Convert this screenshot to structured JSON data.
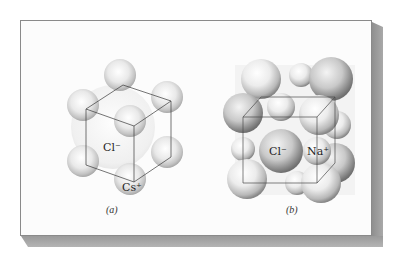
{
  "figure": {
    "panels": [
      {
        "id": "a",
        "caption": "(a)",
        "structure": "cesium-chloride",
        "labels": {
          "center_ion": "Cl⁻",
          "corner_ion": "Cs⁺"
        }
      },
      {
        "id": "b",
        "caption": "(b)",
        "structure": "sodium-chloride",
        "labels": {
          "anion": "Cl⁻",
          "cation": "Na⁺"
        }
      }
    ]
  },
  "colors": {
    "frame_border": "#8a8a8a",
    "shadow": "#9a9a9a",
    "background": "#fcfcfc",
    "cube_lines": "#3a3a3a",
    "sphere_shade": "#7a7a7a"
  }
}
